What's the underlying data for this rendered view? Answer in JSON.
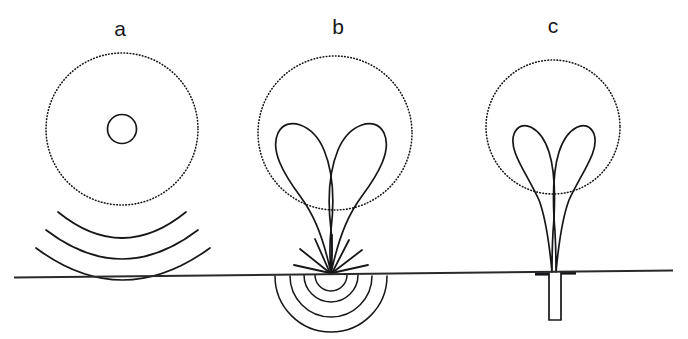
{
  "figure": {
    "width": 688,
    "height": 339,
    "background_color": "#ffffff",
    "ink_color": "#17171a",
    "ground_line": {
      "name": "ground-surface-line",
      "x1": 14,
      "y1": 277.5,
      "x2": 673,
      "y2": 270.5
    }
  },
  "panels": [
    {
      "id": "a",
      "label": "a",
      "label_x": 120,
      "label_y": 36,
      "description": "surface source with isotropic radiation and spherical wavefronts",
      "dotted_circle": {
        "cx": 122,
        "cy": 129,
        "r": 76
      },
      "source_circle": {
        "cx": 122,
        "cy": 129,
        "r": 14.5
      },
      "wavefront_arcs": [
        {
          "cx": 122,
          "cy": 120,
          "r": 96,
          "sweep_deg": 96
        },
        {
          "cx": 122,
          "cy": 110,
          "r": 130,
          "sweep_deg": 100
        },
        {
          "cx": 122,
          "cy": 100,
          "r": 168,
          "sweep_deg": 104
        }
      ],
      "arc_count": 3
    },
    {
      "id": "b",
      "label": "b",
      "label_x": 338,
      "label_y": 34,
      "description": "focused surface source, two-lobed radiation with buried hemispherical wavefronts",
      "dotted_circle": {
        "cx": 335,
        "cy": 133,
        "r": 77
      },
      "focus_point": {
        "x": 331,
        "y": 273
      },
      "lobe_count": 2,
      "ray_count": 7,
      "subsurface_arcs": [
        {
          "r": 16
        },
        {
          "r": 27
        },
        {
          "r": 41
        },
        {
          "r": 56
        }
      ]
    },
    {
      "id": "c",
      "label": "c",
      "label_x": 553,
      "label_y": 33,
      "description": "borehole source, two-lobed radiation with narrow parallel stem into cased hole",
      "dotted_circle": {
        "cx": 553,
        "cy": 127,
        "r": 67
      },
      "stem_top": {
        "x": 554,
        "y": 200
      },
      "borehole": {
        "name": "borehole-casing",
        "x": 549,
        "y_top": 272,
        "width": 12,
        "depth": 48
      },
      "lobe_count": 2
    }
  ],
  "legend": {
    "dotted_circle_meaning": "reference sphere / equal-amplitude envelope",
    "solid_lobe_meaning": "radiation pattern lobe",
    "arc_meaning": "propagating wavefront"
  }
}
